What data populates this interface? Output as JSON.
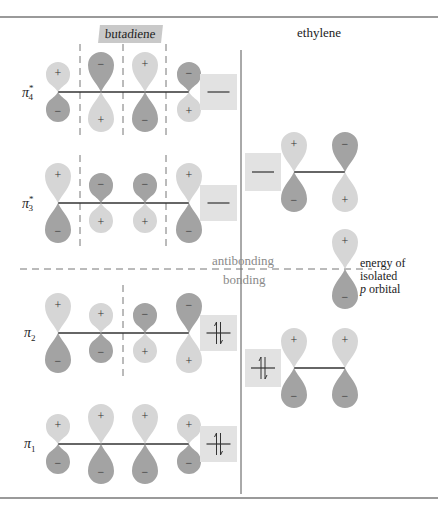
{
  "headers": {
    "butadiene": "butadiene",
    "ethylene": "ethylene"
  },
  "divider_labels": {
    "antibonding": "antibonding",
    "bonding": "bonding"
  },
  "isolated_p": {
    "line1": "energy of",
    "line2": "isolated",
    "line3_italic": "p",
    "line3_rest": " orbital"
  },
  "signs": {
    "plus": "+",
    "minus": "−"
  },
  "colors": {
    "plus_lobe": "#d6d6d6",
    "minus_lobe": "#a3a3a3",
    "box": "#e2e2e2",
    "rule": "#9a9a9a",
    "line": "#333333",
    "header_highlight": "#c9c9c9"
  },
  "butadiene_orbitals": [
    {
      "name": "π",
      "sub": "4",
      "sup": "*",
      "occupancy": "empty",
      "signs_top": [
        "+",
        "−",
        "+",
        "−"
      ],
      "lobe_sizes": [
        "s",
        "l",
        "l",
        "s"
      ],
      "nodes": 3
    },
    {
      "name": "π",
      "sub": "3",
      "sup": "*",
      "occupancy": "empty",
      "signs_top": [
        "+",
        "−",
        "−",
        "+"
      ],
      "lobe_sizes": [
        "l",
        "s",
        "s",
        "l"
      ],
      "nodes": 2
    },
    {
      "name": "π",
      "sub": "2",
      "sup": "",
      "occupancy": "paired",
      "signs_top": [
        "+",
        "+",
        "−",
        "−"
      ],
      "lobe_sizes": [
        "l",
        "s",
        "s",
        "l"
      ],
      "nodes": 1
    },
    {
      "name": "π",
      "sub": "1",
      "sup": "",
      "occupancy": "paired",
      "signs_top": [
        "+",
        "+",
        "+",
        "+"
      ],
      "lobe_sizes": [
        "s",
        "l",
        "l",
        "s"
      ],
      "nodes": 0
    }
  ],
  "ethylene_orbitals": [
    {
      "name": "π*",
      "occupancy": "empty",
      "signs_top": [
        "+",
        "−"
      ]
    },
    {
      "name": "π",
      "occupancy": "paired",
      "signs_top": [
        "+",
        "+"
      ]
    }
  ]
}
